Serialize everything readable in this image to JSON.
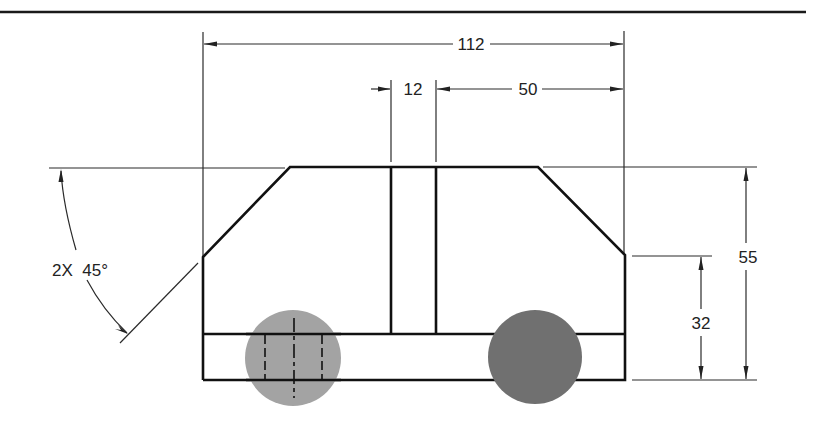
{
  "drawing": {
    "type": "orthographic front view with dimensions",
    "colors": {
      "line": "#111111",
      "wheel_front": "#a3a3a3",
      "wheel_rear": "#707070",
      "background": "#ffffff"
    },
    "dimensions": {
      "overall_width": {
        "label": "112",
        "value": 112
      },
      "gap_width": {
        "label": "12",
        "value": 12
      },
      "right_offset": {
        "label": "50",
        "value": 50
      },
      "overall_height": {
        "label": "55",
        "value": 55
      },
      "side_height": {
        "label": "32",
        "value": 32
      },
      "chamfer_angle": {
        "label": "2X  45°",
        "count": "2X",
        "angle": "45°"
      }
    },
    "features": [
      {
        "name": "body-outline",
        "description": "chamfered top profile with two 45° corners"
      },
      {
        "name": "center-slot",
        "description": "vertical slot 12 wide"
      },
      {
        "name": "base-band",
        "description": "horizontal base strip"
      },
      {
        "name": "front-wheel",
        "description": "light gray circle with hidden lines and center line"
      },
      {
        "name": "rear-wheel",
        "description": "dark gray circle"
      }
    ]
  }
}
